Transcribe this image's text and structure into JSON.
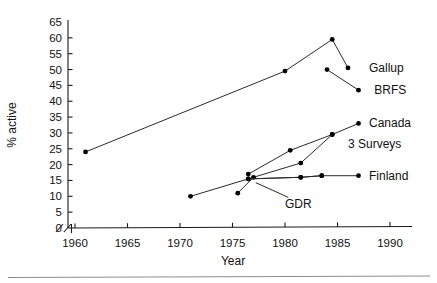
{
  "chart_data": {
    "type": "line",
    "title": "",
    "xlabel": "Year",
    "ylabel": "% active",
    "xlim": [
      1958.5,
      1992.5
    ],
    "ylim": [
      0,
      66
    ],
    "grid": false,
    "legend_position": "inline-right-of-series-endpoints",
    "axis_break": {
      "x": true,
      "y": true,
      "note": "slash break marks near origin on both axes"
    },
    "xticks": [
      1960,
      1965,
      1970,
      1975,
      1980,
      1985,
      1990
    ],
    "xticklabels": [
      "1960",
      "1965",
      "1970",
      "1975",
      "1980",
      "1985",
      "1990"
    ],
    "yticks": [
      0,
      5,
      10,
      15,
      20,
      25,
      30,
      35,
      40,
      45,
      50,
      55,
      60,
      65
    ],
    "yticklabels": [
      "0",
      "5",
      "10",
      "15",
      "20",
      "25",
      "30",
      "35",
      "40",
      "45",
      "50",
      "55",
      "60",
      "65"
    ],
    "series": [
      {
        "name": "Gallup",
        "label": "Gallup",
        "label_x": 1988.0,
        "label_y": 50.5,
        "points": [
          {
            "x": 1961.0,
            "y": 24.0
          },
          {
            "x": 1980.0,
            "y": 49.5
          },
          {
            "x": 1984.5,
            "y": 59.5
          },
          {
            "x": 1986.0,
            "y": 50.5
          }
        ]
      },
      {
        "name": "BRFS",
        "label": "BRFS",
        "label_x": 1988.5,
        "label_y": 43.5,
        "points": [
          {
            "x": 1984.0,
            "y": 50.0
          },
          {
            "x": 1987.0,
            "y": 43.5
          }
        ]
      },
      {
        "name": "Canada",
        "label": "Canada",
        "label_x": 1988.0,
        "label_y": 33.0,
        "points": [
          {
            "x": 1976.5,
            "y": 17.0
          },
          {
            "x": 1980.5,
            "y": 24.5
          },
          {
            "x": 1984.5,
            "y": 29.5
          },
          {
            "x": 1987.0,
            "y": 33.0
          }
        ]
      },
      {
        "name": "3 Surveys",
        "label": "3 Surveys",
        "label_x": 1986.0,
        "label_y": 26.5,
        "points": [
          {
            "x": 1975.5,
            "y": 11.0
          },
          {
            "x": 1977.0,
            "y": 16.0
          },
          {
            "x": 1981.5,
            "y": 20.5
          },
          {
            "x": 1984.5,
            "y": 29.5
          }
        ]
      },
      {
        "name": "Finland",
        "label": "Finland",
        "label_x": 1988.0,
        "label_y": 16.5,
        "points": [
          {
            "x": 1976.5,
            "y": 15.5
          },
          {
            "x": 1981.5,
            "y": 16.0
          },
          {
            "x": 1983.5,
            "y": 16.5
          },
          {
            "x": 1987.0,
            "y": 16.5
          }
        ]
      },
      {
        "name": "GDR",
        "label": "GDR",
        "label_x": 1980.0,
        "label_y": 7.5,
        "points": [
          {
            "x": 1971.0,
            "y": 10.0
          },
          {
            "x": 1976.5,
            "y": 15.5
          },
          {
            "x": 1981.5,
            "y": 16.0
          },
          {
            "x": 1983.5,
            "y": 16.5
          }
        ]
      }
    ]
  }
}
